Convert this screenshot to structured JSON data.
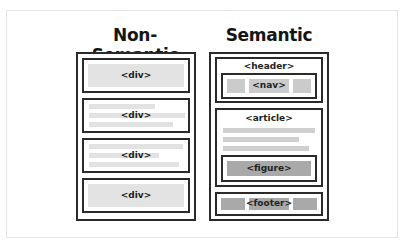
{
  "diagram": {
    "left": {
      "title": "Non-Semantic",
      "blocks": [
        {
          "label": "<div>",
          "style": "solid"
        },
        {
          "label": "<div>",
          "style": "text-lines"
        },
        {
          "label": "<div>",
          "style": "text-lines"
        },
        {
          "label": "<div>",
          "style": "solid"
        }
      ]
    },
    "right": {
      "title": "Semantic",
      "header": {
        "label": "<header>",
        "nav": {
          "label": "<nav>"
        }
      },
      "article": {
        "label": "<article>",
        "figure": {
          "label": "<figure>"
        }
      },
      "footer": {
        "label": "<footer>"
      }
    },
    "colors": {
      "border": "#2a2a2a",
      "light_fill": "#e3e3e3",
      "mid_fill": "#cbcbcb",
      "dark_fill": "#a9a9a9"
    }
  }
}
